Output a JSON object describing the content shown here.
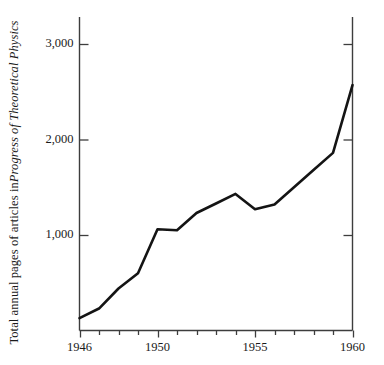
{
  "chart_data": {
    "type": "line",
    "title": "",
    "subtitle": "",
    "xlabel": "",
    "ylabel": "Total annual pages of articles in Progress of Theoretical Physics",
    "ylabel_plain_prefix": "Total annual pages of articles in ",
    "ylabel_italic_part": "Progress of Theoretical Physics",
    "x": [
      1946,
      1947,
      1948,
      1949,
      1950,
      1951,
      1952,
      1953,
      1954,
      1955,
      1956,
      1957,
      1958,
      1959,
      1960
    ],
    "values": [
      130,
      230,
      440,
      600,
      1060,
      1050,
      1230,
      1330,
      1430,
      1270,
      1320,
      1500,
      1680,
      1860,
      2570
    ],
    "series": [
      {
        "name": "Total annual pages",
        "values": [
          130,
          230,
          440,
          600,
          1060,
          1050,
          1230,
          1330,
          1430,
          1270,
          1320,
          1500,
          1680,
          1860,
          2570
        ]
      }
    ],
    "xlim": [
      1946,
      1960
    ],
    "ylim": [
      0,
      3180
    ],
    "xticks_major": [
      1946,
      1950,
      1955,
      1960
    ],
    "xtick_labels": [
      "1946",
      "1950",
      "1955",
      "1960"
    ],
    "xticks_minor": [
      1947,
      1948,
      1949,
      1951,
      1952,
      1953,
      1954,
      1956,
      1957,
      1958,
      1959
    ],
    "yticks": [
      1000,
      2000,
      3000
    ],
    "ytick_labels": [
      "1,000",
      "2,000",
      "3,000"
    ],
    "grid": false,
    "legend": "none",
    "line_color": "#141414",
    "axis_color": "#3d3d3d",
    "background_color": "#ffffff",
    "line_width": 2.6
  }
}
